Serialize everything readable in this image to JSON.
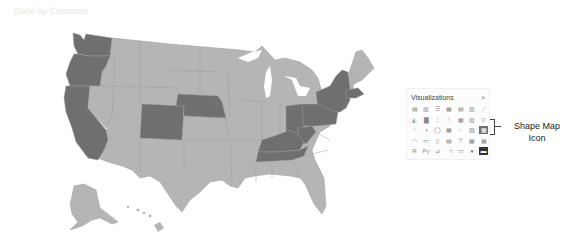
{
  "map": {
    "title": "State by Customer",
    "colors": {
      "highlighted": "#6f6f6f",
      "default": "#b5b5b5",
      "border": "#9c9c9c"
    },
    "highlighted_states": [
      "WA",
      "OR",
      "CA",
      "CO",
      "NE",
      "OH",
      "PA",
      "NY",
      "VT",
      "MA",
      "KY",
      "TN",
      "WV"
    ]
  },
  "visualizations_panel": {
    "title": "Visualizations",
    "expand_icon": "chevron-right-icon",
    "expand_glyph": ">",
    "icons": [
      {
        "name": "stacked-bar-chart-icon",
        "glyph": "▤"
      },
      {
        "name": "stacked-column-chart-icon",
        "glyph": "▥"
      },
      {
        "name": "clustered-bar-chart-icon",
        "glyph": "☰"
      },
      {
        "name": "clustered-column-chart-icon",
        "glyph": "▦"
      },
      {
        "name": "100-stacked-bar-icon",
        "glyph": "▤"
      },
      {
        "name": "100-stacked-column-icon",
        "glyph": "▥"
      },
      {
        "name": "line-chart-icon",
        "glyph": "⟋"
      },
      {
        "name": "area-chart-icon",
        "glyph": "◭"
      },
      {
        "name": "stacked-area-chart-icon",
        "glyph": "▇"
      },
      {
        "name": "line-clustered-column-icon",
        "glyph": "⫶"
      },
      {
        "name": "line-stacked-column-icon",
        "glyph": "⫶"
      },
      {
        "name": "ribbon-chart-icon",
        "glyph": "▦"
      },
      {
        "name": "waterfall-chart-icon",
        "glyph": "▥"
      },
      {
        "name": "funnel-icon",
        "glyph": "▽"
      },
      {
        "name": "scatter-chart-icon",
        "glyph": "⁘"
      },
      {
        "name": "pie-chart-icon",
        "glyph": "◑"
      },
      {
        "name": "donut-chart-icon",
        "glyph": "◯"
      },
      {
        "name": "treemap-icon",
        "glyph": "▦"
      },
      {
        "name": "map-icon",
        "glyph": "◌"
      },
      {
        "name": "filled-map-icon",
        "glyph": "▨"
      },
      {
        "name": "shape-map-icon",
        "glyph": "▩",
        "selected": true
      },
      {
        "name": "gauge-icon",
        "glyph": "◠"
      },
      {
        "name": "card-icon",
        "glyph": "▭"
      },
      {
        "name": "multi-row-card-icon",
        "glyph": "▯"
      },
      {
        "name": "kpi-icon",
        "glyph": "▤"
      },
      {
        "name": "slicer-icon",
        "glyph": "⊤"
      },
      {
        "name": "table-icon",
        "glyph": "▦"
      },
      {
        "name": "matrix-icon",
        "glyph": "▦"
      },
      {
        "name": "r-script-icon",
        "glyph": "R"
      },
      {
        "name": "python-icon",
        "glyph": "Py"
      },
      {
        "name": "key-influencers-icon",
        "glyph": "⊿"
      },
      {
        "name": "decomposition-tree-icon",
        "glyph": "⊣"
      },
      {
        "name": "qa-icon",
        "glyph": "▭"
      },
      {
        "name": "arcgis-icon",
        "glyph": "●"
      },
      {
        "name": "power-apps-icon",
        "glyph": "▬",
        "dark": true
      }
    ],
    "more_label": "···"
  },
  "annotation": {
    "label": "Shape Map Icon"
  }
}
